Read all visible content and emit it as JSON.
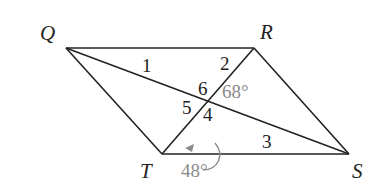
{
  "vertices": {
    "Q": "Q",
    "R": "R",
    "S": "S",
    "T": "T"
  },
  "angle_numbers": [
    "1",
    "2",
    "3",
    "4",
    "5",
    "6"
  ],
  "given_angles": {
    "angle_near_6": "68°",
    "angle_at_T": "48°"
  },
  "colors": {
    "line": "#222222",
    "given": "#8a8a8a"
  }
}
